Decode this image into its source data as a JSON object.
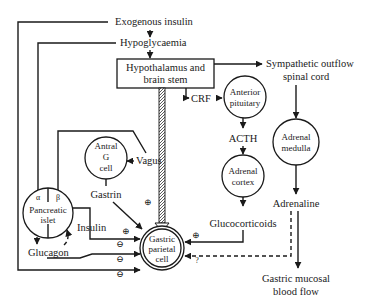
{
  "diagram": {
    "nodes": {
      "exogenous_insulin": "Exogenous insulin",
      "hypoglycaemia": "Hypoglycaemia",
      "hypothalamus_l1": "Hypothalamus and",
      "hypothalamus_l2": "brain stem",
      "sympathetic_l1": "Sympathetic outflow",
      "sympathetic_l2": "spinal cord",
      "crf": "CRF",
      "anterior_pituitary_l1": "Anterior",
      "anterior_pituitary_l2": "pituitary",
      "acth": "ACTH",
      "adrenal_cortex_l1": "Adrenal",
      "adrenal_cortex_l2": "cortex",
      "glucocorticoids": "Glucocorticoids",
      "adrenal_medulla_l1": "Adrenal",
      "adrenal_medulla_l2": "medulla",
      "adrenaline": "Adrenaline",
      "gastric_blood_flow_l1": "Gastric mucosal",
      "gastric_blood_flow_l2": "blood flow",
      "vagus": "Vagus",
      "antral_g_cell_l1": "Antral",
      "antral_g_cell_l2": "G",
      "antral_g_cell_l3": "cell",
      "gastrin": "Gastrin",
      "pancreatic_islet_alpha": "α",
      "pancreatic_islet_beta": "β",
      "pancreatic_islet_l1": "Pancreatic",
      "pancreatic_islet_l2": "islet",
      "insulin": "Insulin",
      "glucagon": "Glucagon",
      "parietal_cell_l1": "Gastric",
      "parietal_cell_l2": "parietal",
      "parietal_cell_l3": "cell"
    },
    "signs": {
      "plus": "⊕",
      "minus": "⊖",
      "unknown": "?"
    }
  }
}
